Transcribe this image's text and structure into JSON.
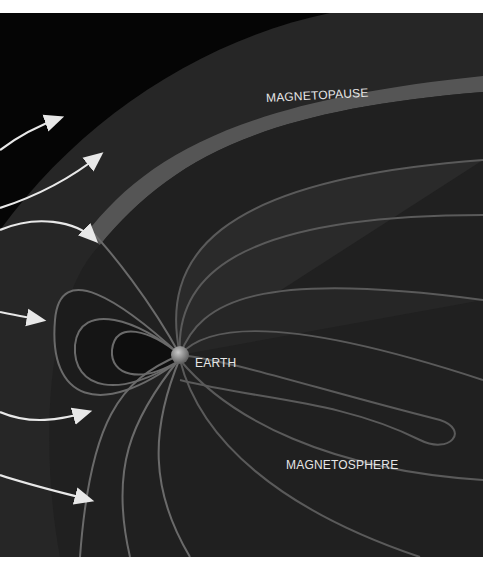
{
  "diagram": {
    "labels": {
      "magnetopause": "MAGNETOPAUSE",
      "earth": "EARTH",
      "magnetosphere": "MAGNETOSPHERE"
    },
    "solar_wind_arrows": 6,
    "colors": {
      "background": "#050505",
      "surface": "#2e2e2e",
      "surface_highlight": "#5a5a5a",
      "arrow": "#e8e8e8",
      "earth": "#8a8a8a",
      "page": "#ffffff"
    }
  }
}
